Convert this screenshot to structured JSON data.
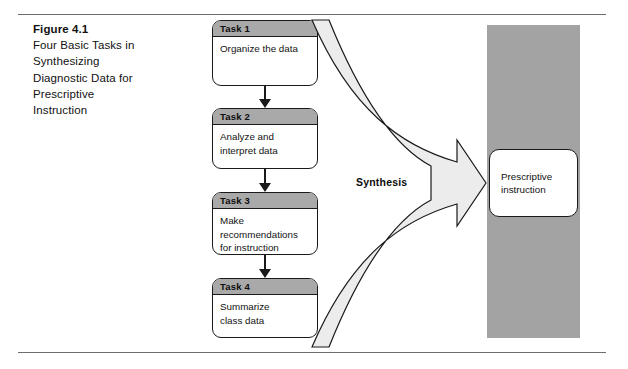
{
  "figure": {
    "caption_title": "Figure 4.1",
    "caption_body": "Four Basic Tasks in\nSynthesizing\nDiagnostic Data for\nPrescriptive\nInstruction"
  },
  "tasks": [
    {
      "header": "Task 1",
      "body": "Organize the data"
    },
    {
      "header": "Task 2",
      "body": "Analyze and\ninterpret data"
    },
    {
      "header": "Task 3",
      "body": "Make\nrecommendations\nfor instruction"
    },
    {
      "header": "Task 4",
      "body": "Summarize\nclass data"
    }
  ],
  "synthesis": {
    "label": "Synthesis"
  },
  "outcome": {
    "label": "Prescriptive\ninstruction"
  },
  "colors": {
    "task_header_gray": "#a9a9a9",
    "column_gray": "#a3a3a3",
    "funnel_fill": "#ececec",
    "outline": "#1a1a1a",
    "rule": "#6d6d6d"
  }
}
